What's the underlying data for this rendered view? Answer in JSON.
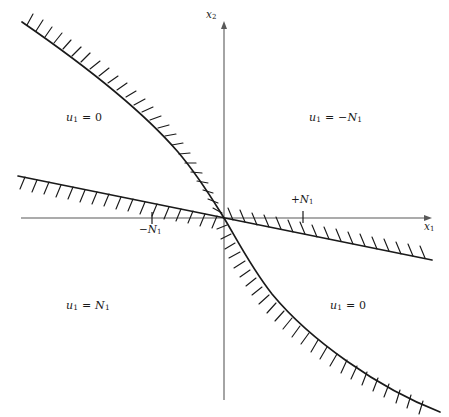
{
  "figure": {
    "background_color": "#ffffff",
    "stroke_color": "#1a1a1a",
    "axis_color": "#4d4d4d"
  },
  "axes": {
    "horizontal": {
      "label_text": "x",
      "label_sub": "1",
      "origin_x": 224,
      "y": 218,
      "x_start": 21,
      "x_end": 432,
      "arrow": "right"
    },
    "vertical": {
      "label_text": "x",
      "label_sub": "2",
      "origin_y": 218,
      "x": 224,
      "y_start": 22,
      "y_end": 400,
      "arrow": "up"
    }
  },
  "ticks": [
    {
      "name": "tick-negative-N1",
      "sign": "−",
      "text": "N",
      "sub": "1",
      "x": 152,
      "y": 218,
      "label_position": "below"
    },
    {
      "name": "tick-positive-N1",
      "sign": "+",
      "text": "N",
      "sub": "1",
      "x": 303,
      "y": 218,
      "label_position": "above"
    }
  ],
  "region_labels": [
    {
      "name": "region-label-upper-left",
      "var": "u",
      "sub": "1",
      "eq": "=",
      "value": "0",
      "x": 66,
      "y": 111,
      "quadrant": "upper-left"
    },
    {
      "name": "region-label-upper-right",
      "var": "u",
      "sub": "1",
      "eq": "=",
      "value": "−N₁",
      "value_sign": "−",
      "value_text": "N",
      "value_sub": "1",
      "x": 309,
      "y": 111,
      "quadrant": "upper-right"
    },
    {
      "name": "region-label-lower-left",
      "var": "u",
      "sub": "1",
      "eq": "=",
      "value": "N₁",
      "value_text": "N",
      "value_sub": "1",
      "x": 66,
      "y": 299,
      "quadrant": "lower-left"
    },
    {
      "name": "region-label-lower-right",
      "var": "u",
      "sub": "1",
      "eq": "=",
      "value": "0",
      "x": 330,
      "y": 299,
      "quadrant": "lower-right"
    }
  ],
  "curves": [
    {
      "name": "switching-curve-upper-left",
      "type": "parabolic-switching-curve",
      "description": "curve from upper-left descending to origin, hatched on upper-right side",
      "hatch_side": "right",
      "hatch_count": 26,
      "points": [
        [
          22,
          22
        ],
        [
          34,
          33
        ],
        [
          48,
          45
        ],
        [
          62,
          56
        ],
        [
          76,
          66
        ],
        [
          90,
          76
        ],
        [
          104,
          86
        ],
        [
          118,
          96
        ],
        [
          131,
          106
        ],
        [
          143,
          116
        ],
        [
          154,
          126
        ],
        [
          164,
          136
        ],
        [
          173,
          146
        ],
        [
          181,
          156
        ],
        [
          189,
          166
        ],
        [
          196,
          176
        ],
        [
          203,
          186
        ],
        [
          209,
          196
        ],
        [
          214,
          204
        ],
        [
          218,
          211
        ],
        [
          222,
          216
        ],
        [
          224,
          218
        ]
      ]
    },
    {
      "name": "switching-curve-lower-right",
      "type": "parabolic-switching-curve",
      "description": "curve from origin descending to lower-right, hatched on lower-left side",
      "hatch_side": "left",
      "hatch_count": 26,
      "points": [
        [
          224,
          218
        ],
        [
          226,
          220
        ],
        [
          230,
          225
        ],
        [
          234,
          232
        ],
        [
          239,
          242
        ],
        [
          244,
          252
        ],
        [
          249,
          262
        ],
        [
          255,
          272
        ],
        [
          262,
          282
        ],
        [
          270,
          292
        ],
        [
          279,
          302
        ],
        [
          289,
          312
        ],
        [
          300,
          322
        ],
        [
          312,
          332
        ],
        [
          325,
          342
        ],
        [
          339,
          352
        ],
        [
          354,
          362
        ],
        [
          370,
          372
        ],
        [
          387,
          382
        ],
        [
          405,
          392
        ],
        [
          424,
          402
        ],
        [
          440,
          410
        ]
      ]
    },
    {
      "name": "switching-line",
      "type": "straight-switching-line",
      "description": "straight line through origin with small negative slope, hatched alternating side",
      "hatch_count": 34,
      "points": [
        [
          18,
          176
        ],
        [
          224,
          218
        ],
        [
          432,
          260
        ]
      ],
      "x_start": 18,
      "y_start": 176,
      "x_end": 432,
      "y_end": 260
    }
  ]
}
